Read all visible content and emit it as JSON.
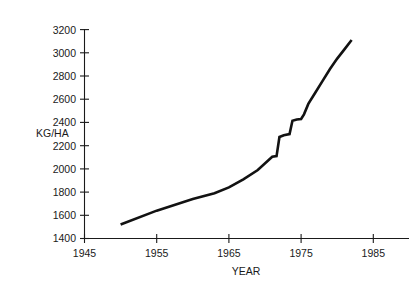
{
  "chart_data": {
    "type": "line",
    "title": "",
    "xlabel": "YEAR",
    "ylabel": "KG/HA",
    "xlim": [
      1945,
      1988
    ],
    "ylim": [
      1400,
      3200
    ],
    "grid": false,
    "legend": "none",
    "xticks": [
      1945,
      1955,
      1965,
      1975,
      1985
    ],
    "xtick_labels": [
      "1945",
      "1955",
      "1965",
      "1975",
      "1985"
    ],
    "yticks": [
      1400,
      1600,
      1800,
      2000,
      2200,
      2400,
      2600,
      2800,
      3000,
      3200
    ],
    "ytick_labels": [
      "1400",
      "1600",
      "1800",
      "2000",
      "2200",
      "2400",
      "2600",
      "2800",
      "3000",
      "3200"
    ],
    "series": [
      {
        "name": "yield",
        "color": "#121212",
        "x": [
          1950.0,
          1955.0,
          1960.0,
          1963.0,
          1965.0,
          1967.0,
          1969.0,
          1971.0,
          1971.6,
          1972.0,
          1972.6,
          1973.4,
          1973.8,
          1974.4,
          1975.0,
          1975.4,
          1976.0,
          1977.0,
          1978.0,
          1979.0,
          1980.0,
          1981.0,
          1982.0
        ],
        "y": [
          1520,
          1640,
          1740,
          1790,
          1840,
          1910,
          1990,
          2105,
          2110,
          2275,
          2290,
          2300,
          2415,
          2425,
          2430,
          2470,
          2560,
          2660,
          2760,
          2860,
          2950,
          3030,
          3110
        ]
      }
    ]
  },
  "axes": {
    "x_title": "YEAR",
    "y_title": "KG/HA"
  }
}
